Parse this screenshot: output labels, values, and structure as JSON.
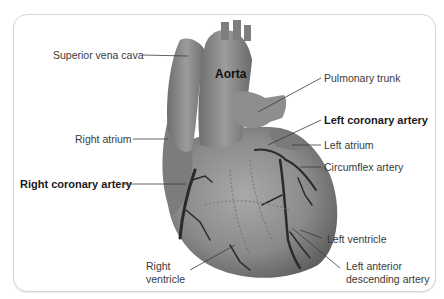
{
  "diagram": {
    "labels": {
      "superior_vena_cava": "Superior vena cava",
      "aorta": "Aorta",
      "pulmonary_trunk": "Pulmonary trunk",
      "left_coronary_artery": "Left coronary artery",
      "left_atrium": "Left atrium",
      "right_atrium": "Right atrium",
      "circumflex_artery": "Circumflex artery",
      "right_coronary_artery": "Right coronary artery",
      "left_ventricle": "Left ventricle",
      "right_ventricle_line1": "Right",
      "right_ventricle_line2": "ventricle",
      "lad_line1": "Left anterior",
      "lad_line2": "descending artery"
    },
    "emphasized_labels": [
      "Aorta",
      "Left coronary artery",
      "Right coronary artery"
    ],
    "colors": {
      "heart_fill": "#8a8a8a",
      "vessel_dark": "#2a2a2a",
      "frame_border": "#d4d4d4",
      "label_text": "#3a3a3a"
    }
  }
}
